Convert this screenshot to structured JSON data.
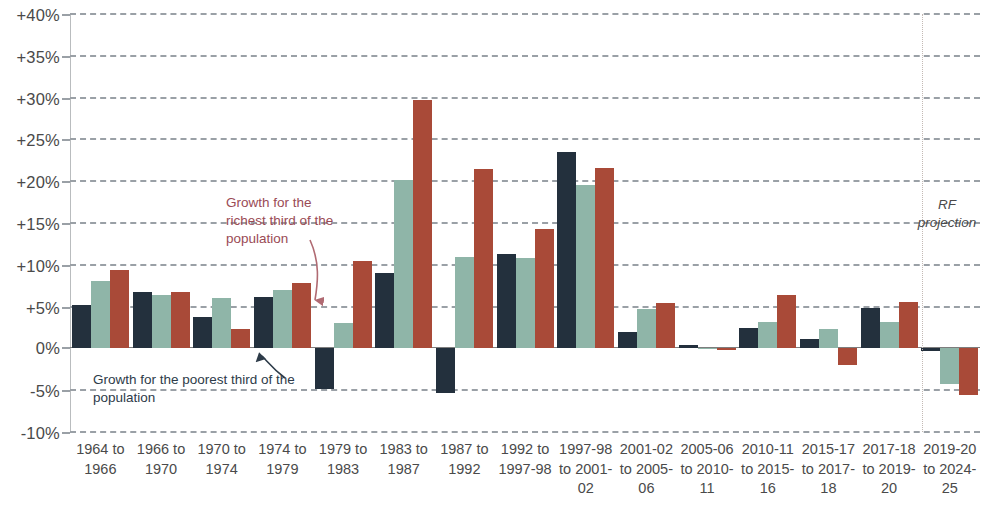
{
  "chart_data": {
    "type": "bar",
    "title": "",
    "subtitle": "",
    "xlabel": "",
    "ylabel": "",
    "ylim": [
      -10,
      40
    ],
    "ytick_step": 5,
    "grid": true,
    "legend_position": "none",
    "yticks": [
      "+40%",
      "+35%",
      "+30%",
      "+25%",
      "+20%",
      "+15%",
      "+10%",
      "+5%",
      "0%",
      "-5%",
      "-10%"
    ],
    "ytick_values": [
      40,
      35,
      30,
      25,
      20,
      15,
      10,
      5,
      0,
      -5,
      -10
    ],
    "categories": [
      "1964 to 1966",
      "1966 to 1970",
      "1970 to 1974",
      "1974 to 1979",
      "1979 to 1983",
      "1983 to 1987",
      "1987 to 1992",
      "1992 to 1997-98",
      "1997-98 to 2001-02",
      "2001-02 to 2005-06",
      "2005-06 to 2010-11",
      "2010-11 to 2015-16",
      "2015-17 to 2017-18",
      "2017-18 to 2019-20",
      "2019-20 to 2024-25"
    ],
    "series": [
      {
        "name": "Growth for the poorest third of the population",
        "color": "#23303d",
        "values": [
          5.2,
          6.8,
          3.8,
          6.1,
          -4.9,
          9.0,
          -5.3,
          11.3,
          23.5,
          2.0,
          0.4,
          2.4,
          1.1,
          4.8,
          -0.3
        ]
      },
      {
        "name": "Middle third",
        "color": "#8fb5a8",
        "values": [
          8.1,
          6.4,
          6.0,
          7.0,
          3.0,
          20.2,
          10.9,
          10.8,
          19.6,
          4.7,
          0.1,
          3.2,
          2.3,
          3.2,
          -4.3
        ]
      },
      {
        "name": "Growth for the richest third of the population",
        "color": "#a94a38",
        "values": [
          9.4,
          6.8,
          2.3,
          7.8,
          10.4,
          29.7,
          21.5,
          14.3,
          21.6,
          5.4,
          -0.2,
          6.4,
          -2.0,
          5.6,
          -5.6
        ]
      }
    ],
    "annotations": [
      {
        "id": "richest",
        "text": "Growth for the richest third of the population",
        "color": "#9a4b55"
      },
      {
        "id": "poorest",
        "text": "Growth for the poorest third of the population",
        "color": "#2d3b49"
      },
      {
        "id": "projection",
        "text": "RF projection",
        "style": "italic"
      }
    ]
  },
  "axis": {
    "ytick_labels": [
      "+40%",
      "+35%",
      "+30%",
      "+25%",
      "+20%",
      "+15%",
      "+10%",
      "+5%",
      "0%",
      "-5%",
      "-10%"
    ],
    "xtick_labels": [
      "1964 to\n1966",
      "1966 to\n1970",
      "1970 to\n1974",
      "1974 to\n1979",
      "1979 to\n1983",
      "1983 to\n1987",
      "1987 to\n1992",
      "1992 to\n1997-98",
      "1997-98\nto 2001-\n02",
      "2001-02\nto 2005-\n06",
      "2005-06\nto 2010-\n11",
      "2010-11\nto 2015-\n16",
      "2015-17\nto 2017-\n18",
      "2017-18\nto 2019-\n20",
      "2019-20\nto 2024-\n25"
    ]
  },
  "annotations": {
    "richest_label": "Growth for the richest third of the population",
    "poorest_label": "Growth for the poorest third of the population",
    "projection_label": "RF projection"
  },
  "colors": {
    "poorest": "#23303d",
    "middle": "#8fb5a8",
    "richest": "#a94a38",
    "gridline": "#9aa0a6",
    "annotation_richest": "#9a4b55",
    "annotation_poorest": "#2d3b49"
  }
}
